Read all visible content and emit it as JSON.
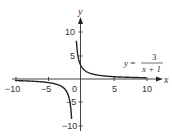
{
  "chart_data": {
    "type": "line",
    "title": "",
    "function": "y = 3/(x+1)",
    "equation_label": {
      "lhs": "y =",
      "numerator": "3",
      "denominator": "x + 1"
    },
    "xlabel": "x",
    "ylabel": "y",
    "xlim": [
      -10,
      10
    ],
    "ylim": [
      -10,
      10
    ],
    "x_ticks": [
      -10,
      -5,
      0,
      5,
      10
    ],
    "x_tick_labels": [
      "−10",
      "−5",
      "0",
      "5",
      "10"
    ],
    "y_ticks": [
      -10,
      -5,
      5,
      10
    ],
    "y_tick_labels": [
      "−10",
      "−5",
      "5",
      "10"
    ],
    "vertical_asymptote": -1,
    "horizontal_asymptote": 0,
    "grid": false,
    "series": [
      {
        "name": "right branch",
        "x": [
          -0.7,
          -0.5,
          0,
          0.5,
          1,
          2,
          3,
          5,
          7,
          10
        ],
        "y": [
          10,
          6,
          3,
          2,
          1.5,
          1,
          0.75,
          0.5,
          0.375,
          0.27
        ]
      },
      {
        "name": "left branch",
        "x": [
          -10,
          -7,
          -5,
          -3,
          -2,
          -1.5,
          -1.3
        ],
        "y": [
          -0.33,
          -0.5,
          -0.75,
          -1.5,
          -3,
          -6,
          -10
        ]
      }
    ],
    "curve_color": "#222222",
    "axis_color": "#333333"
  }
}
